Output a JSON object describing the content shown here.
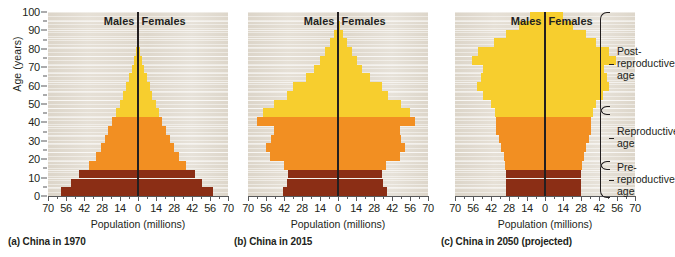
{
  "figure": {
    "axis_title_x": "Population (millions)",
    "axis_title_y": "Age (years)",
    "males_label": "Males",
    "females_label": "Females",
    "y_ticks": [
      0,
      10,
      20,
      30,
      40,
      50,
      60,
      70,
      80,
      90,
      100
    ],
    "x_ticks": [
      "70",
      "56",
      "42",
      "28",
      "14",
      "0",
      "14",
      "28",
      "42",
      "56",
      "70"
    ],
    "x_tick_values": [
      -70,
      -56,
      -42,
      -28,
      -14,
      0,
      14,
      28,
      42,
      56,
      70
    ],
    "colors": {
      "pre_reproductive": "#8B2E15",
      "reproductive": "#F28F22",
      "post_reproductive": "#F7CE2E",
      "plot_background": "#E3DDD3",
      "axis": "#58595B",
      "text": "#231F20"
    },
    "brackets": [
      {
        "name": "post-reproductive",
        "label": "Post-\nreproductive\nage",
        "age_from": 45,
        "age_to": 100
      },
      {
        "name": "reproductive",
        "label": "Reproductive\nage",
        "age_from": 15,
        "age_to": 44
      },
      {
        "name": "pre-reproductive",
        "label": "Pre-\nreproductive\nage",
        "age_from": 0,
        "age_to": 14
      }
    ]
  },
  "chart_data": [
    {
      "type": "bar",
      "id": "china-1970",
      "title": "(a) China in 1970",
      "xlabel": "Population (millions)",
      "ylabel": "Age (years)",
      "xlim": [
        -70,
        70
      ],
      "ylim": [
        0,
        100
      ],
      "grid": true,
      "categories": [
        "0-4",
        "5-9",
        "10-14",
        "15-19",
        "20-24",
        "25-29",
        "30-34",
        "35-39",
        "40-44",
        "45-49",
        "50-54",
        "55-59",
        "60-64",
        "65-69",
        "70-74",
        "75-79",
        "80-84",
        "85-89",
        "90-94",
        "95-99",
        "100+"
      ],
      "series": [
        {
          "name": "Males",
          "values": [
            60,
            52,
            46,
            38,
            33,
            29,
            26,
            23,
            20,
            17,
            14,
            12,
            9,
            7,
            5,
            3,
            1.5,
            0.6,
            0.2,
            0.05,
            0
          ]
        },
        {
          "name": "Females",
          "values": [
            58,
            50,
            44,
            37,
            32,
            28,
            25,
            22,
            19,
            16,
            14,
            11,
            9,
            7,
            5,
            3,
            1.5,
            0.6,
            0.2,
            0.05,
            0
          ]
        }
      ]
    },
    {
      "type": "bar",
      "id": "china-2015",
      "title": "(b) China in 2015",
      "xlabel": "Population (millions)",
      "ylabel": "Age (years)",
      "xlim": [
        -70,
        70
      ],
      "ylim": [
        0,
        100
      ],
      "grid": true,
      "categories": [
        "0-4",
        "5-9",
        "10-14",
        "15-19",
        "20-24",
        "25-29",
        "30-34",
        "35-39",
        "40-44",
        "45-49",
        "50-54",
        "55-59",
        "60-64",
        "65-69",
        "70-74",
        "75-79",
        "80-84",
        "85-89",
        "90-94",
        "95-99",
        "100+"
      ],
      "series": [
        {
          "name": "Males",
          "values": [
            43,
            40,
            39,
            42,
            53,
            56,
            52,
            50,
            63,
            58,
            50,
            40,
            35,
            25,
            19,
            14,
            10,
            6,
            3,
            1,
            0.3
          ]
        },
        {
          "name": "Females",
          "values": [
            38,
            35,
            34,
            37,
            48,
            52,
            49,
            48,
            60,
            56,
            49,
            39,
            34,
            25,
            19,
            15,
            11,
            7,
            4,
            1.5,
            0.4
          ]
        }
      ]
    },
    {
      "type": "bar",
      "id": "china-2050-projected",
      "title": "(c) China in 2050 (projected)",
      "xlabel": "Population (millions)",
      "ylabel": "Age (years)",
      "xlim": [
        -70,
        70
      ],
      "ylim": [
        0,
        100
      ],
      "grid": true,
      "categories": [
        "0-4",
        "5-9",
        "10-14",
        "15-19",
        "20-24",
        "25-29",
        "30-34",
        "35-39",
        "40-44",
        "45-49",
        "50-54",
        "55-59",
        "60-64",
        "65-69",
        "70-74",
        "75-79",
        "80-84",
        "85-89",
        "90-94",
        "95-99",
        "100+"
      ],
      "series": [
        {
          "name": "Males",
          "values": [
            30,
            30,
            30,
            31,
            32,
            34,
            36,
            38,
            38,
            39,
            42,
            48,
            53,
            50,
            48,
            57,
            52,
            40,
            30,
            20,
            12
          ]
        },
        {
          "name": "Females",
          "values": [
            28,
            28,
            28,
            29,
            30,
            32,
            34,
            36,
            36,
            37,
            40,
            45,
            50,
            48,
            46,
            55,
            50,
            40,
            32,
            22,
            14
          ]
        }
      ]
    }
  ],
  "captions": {
    "a": "(a) China in 1970",
    "b": "(b) China in 2015",
    "c": "(c) China in 2050 (projected)"
  }
}
